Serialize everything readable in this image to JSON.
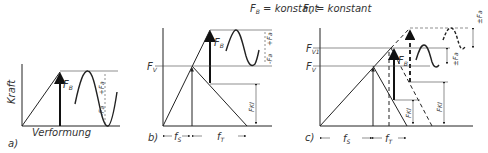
{
  "panels": {
    "a": {
      "caption": "a)",
      "y_axis_label": "Kraft",
      "x_axis_label": "Verformung",
      "force_label": "F",
      "force_sub": "B",
      "amp_plus": "+F",
      "amp_plus_sub": "a",
      "amp_minus": "-F",
      "amp_minus_sub": "a"
    },
    "b": {
      "caption": "b)",
      "heading": "F",
      "heading_sub": "B",
      "heading_rest": " = konstant",
      "preload_label": "F",
      "preload_sub": "V",
      "force_label": "F",
      "force_sub": "B",
      "amp_plus": "+F",
      "amp_plus_sub": "a",
      "amp_minus": "-F",
      "amp_minus_sub": "a",
      "clamp_label": "F",
      "clamp_sub": "Kl",
      "fs_label": "f",
      "fs_sub": "S",
      "ft_label": "f",
      "ft_sub": "T"
    },
    "c": {
      "caption": "c)",
      "heading": "F",
      "heading_sub": "V",
      "heading_rest": " = konstant",
      "preload1_label": "F",
      "preload1_sub": "V1",
      "preload_label": "F",
      "preload_sub": "V",
      "force_label": "F",
      "force_sub": "B",
      "amp_plus": "±F",
      "amp_plus_sub": "a",
      "amp_minus": "±F",
      "amp_minus_sub": "a",
      "clamp_label": "F",
      "clamp_sub": "Kl",
      "clamp1_label": "F",
      "clamp1_sub": "Kl",
      "fs_label": "f",
      "fs_sub": "S",
      "ft_label": "f",
      "ft_sub": "T"
    }
  }
}
